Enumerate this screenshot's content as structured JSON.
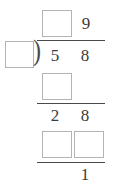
{
  "worksheet": {
    "type": "long-division",
    "bracket_glyph": ")",
    "quotient": {
      "blank_label": "",
      "digits": [
        "",
        "9"
      ]
    },
    "divisor": {
      "blank_label": "",
      "digits": [
        ""
      ]
    },
    "dividend": {
      "digits": [
        "5",
        "8"
      ]
    },
    "step_1": {
      "subtrahend": {
        "blank_label": ""
      },
      "difference": {
        "digits": [
          "2",
          "8"
        ]
      }
    },
    "step_2": {
      "subtrahend": {
        "blank_label_left": "",
        "blank_label_right": ""
      },
      "remainder": "1"
    },
    "colors": {
      "box_border": "#b3b3b3",
      "rule": "#4a4a4a",
      "digit": "#3b3b3b",
      "background": "#ffffff"
    }
  },
  "chart_data": {
    "type": "table",
    "title": "",
    "rows": [
      {
        "label": "quotient",
        "cells": [
          "",
          "9"
        ]
      },
      {
        "label": "divisor",
        "cells": [
          ""
        ]
      },
      {
        "label": "dividend",
        "cells": [
          "5",
          "8"
        ]
      },
      {
        "label": "subtrahend-1",
        "cells": [
          ""
        ]
      },
      {
        "label": "difference-1",
        "cells": [
          "2",
          "8"
        ]
      },
      {
        "label": "subtrahend-2",
        "cells": [
          "",
          ""
        ]
      },
      {
        "label": "remainder",
        "cells": [
          "1"
        ]
      }
    ]
  }
}
